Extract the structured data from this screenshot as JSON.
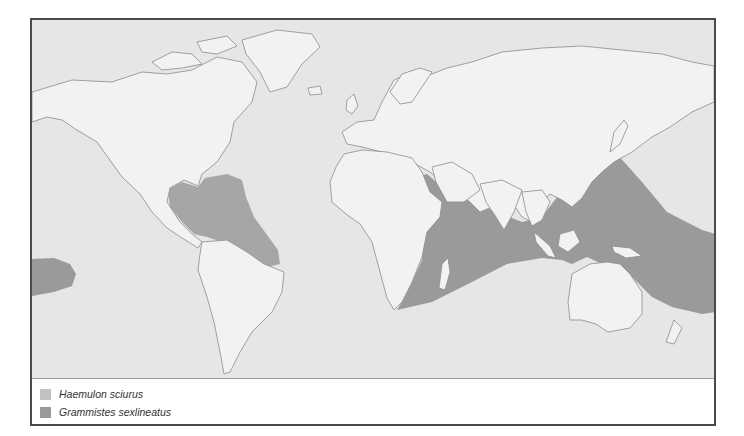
{
  "map": {
    "title": "Species distribution world map",
    "colors": {
      "ocean": "#e6e6e6",
      "land": "#f2f2f2",
      "coastline": "#8c8c8c",
      "haemulon_sciurus": "#b9b9b9",
      "grammistes_sexlineatus": "#9a9a9a",
      "frame": "#4a4a4a"
    },
    "ranges": [
      {
        "species": "Haemulon sciurus",
        "region": "Western Atlantic: Gulf of Mexico, Caribbean Sea, east to mid-Atlantic, south to northeast Brazil"
      },
      {
        "species": "Grammistes sexlineatus",
        "region": "Indo-Pacific: Red Sea, East Africa to southern Japan, Indonesia, northern Australia, central Pacific; also eastern Pacific patch"
      }
    ]
  },
  "legend": {
    "items": [
      {
        "label": "Haemulon sciurus",
        "color": "#c2c2c2"
      },
      {
        "label": "Grammistes sexlineatus",
        "color": "#999999"
      }
    ]
  }
}
